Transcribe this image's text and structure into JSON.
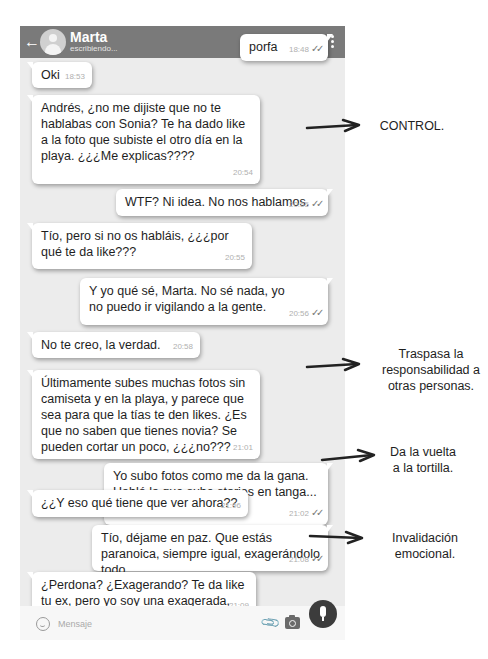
{
  "header": {
    "contact_name": "Marta",
    "status": "escribiendo...",
    "background": "#7a7a7a"
  },
  "messages": [
    {
      "dir": "out",
      "text": "porfa",
      "time": "18:48",
      "ticks": "✓✓"
    },
    {
      "dir": "in",
      "text": "Oki",
      "time": "18:53"
    },
    {
      "dir": "in",
      "text": "Andrés, ¿no me dijiste que no te hablabas con Sonia? Te ha dado like a la foto que subiste el otro día en la playa. ¿¿¿Me explicas????",
      "time": "20:54"
    },
    {
      "dir": "out",
      "text": "WTF? Ni idea. No nos hablamos.",
      "time": "20:55",
      "ticks": "✓✓"
    },
    {
      "dir": "in",
      "text": "Tío, pero si no os habláis, ¿¿¿por qué te da like???",
      "time": "20:55"
    },
    {
      "dir": "out",
      "text": "Y yo qué sé, Marta. No sé nada, yo no puedo ir vigilando a la gente.",
      "time": "20:56",
      "ticks": "✓✓"
    },
    {
      "dir": "in",
      "text": "No te creo, la verdad.",
      "time": "20:58"
    },
    {
      "dir": "in",
      "text": "Últimamente subes muchas fotos sin camiseta y en la playa, y parece que sea para que la tías te den likes. ¿Es que no saben que tienes novia? Se pueden cortar un poco, ¿¿¿no???",
      "time": "21:01"
    },
    {
      "dir": "out",
      "text": "Yo subo fotos como me da la gana. Habló la que sube stories en tanga... Anda que vaya tela.",
      "time": "21:02",
      "ticks": "✓✓"
    },
    {
      "dir": "in",
      "text": "¿¿Y eso qué tiene que ver ahora??",
      "time": "21:06"
    },
    {
      "dir": "out",
      "text": "Tío, déjame en paz. Que estás paranoica, siempre igual, exagerándolo todo.",
      "time": "21:08",
      "ticks": "✓✓"
    },
    {
      "dir": "in",
      "text": "¿Perdona? ¿Exagerando? Te da like tu ex, pero yo soy una exagerada, vale.",
      "time": "21:09"
    }
  ],
  "input": {
    "placeholder": "Mensaje"
  },
  "annotations": [
    {
      "text": "CONTROL."
    },
    {
      "text": "Traspasa la responsabilidad a otras personas."
    },
    {
      "text": "Da la vuelta a la tortilla."
    },
    {
      "text": "Invalidación emocional."
    }
  ],
  "icons": {
    "back": "arrow-left",
    "video": "video-camera",
    "call": "phone",
    "menu": "vertical-dots",
    "emoji": "smiley",
    "attach": "paperclip",
    "camera": "camera",
    "mic": "microphone"
  }
}
